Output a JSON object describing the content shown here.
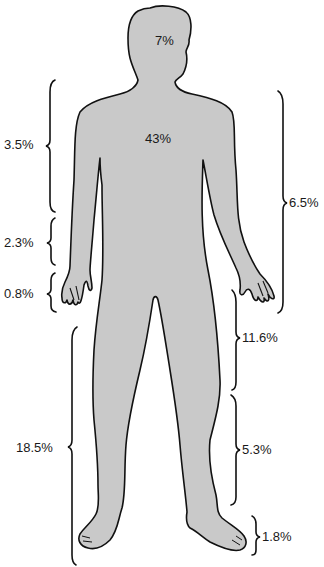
{
  "diagram": {
    "type": "body-surface-area-distribution",
    "colors": {
      "body_fill": "#c9c9c9",
      "outline": "#111111",
      "text": "#1a1a1a",
      "background": "#ffffff"
    },
    "body_labels": {
      "head": "7%",
      "trunk": "43%"
    },
    "left_brackets": [
      {
        "region": "upper-arm",
        "label": "3.5%"
      },
      {
        "region": "forearm",
        "label": "2.3%"
      },
      {
        "region": "hand",
        "label": "0.8%"
      },
      {
        "region": "entire-leg",
        "label": "18.5%"
      }
    ],
    "right_brackets": [
      {
        "region": "entire-arm",
        "label": "6.5%"
      },
      {
        "region": "thigh",
        "label": "11.6%"
      },
      {
        "region": "lower-leg",
        "label": "5.3%"
      },
      {
        "region": "foot",
        "label": "1.8%"
      }
    ]
  }
}
